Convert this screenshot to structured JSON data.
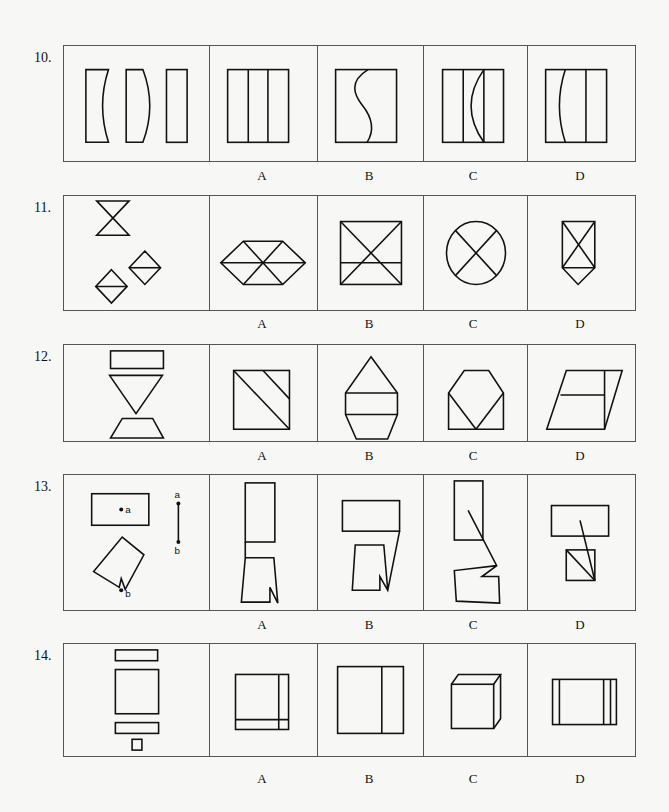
{
  "questions": [
    {
      "number": "10.",
      "options": [
        "A",
        "B",
        "C",
        "D"
      ],
      "stem_description": "three rectangles with curved edges",
      "option_descriptions": [
        "rectangle split into three by two vertical lines",
        "square with an S-curve dividing it",
        "rectangle with one vertical line and one arc",
        "rectangle with an arc and one vertical line"
      ]
    },
    {
      "number": "11.",
      "options": [
        "A",
        "B",
        "C",
        "D"
      ],
      "stem_description": "hourglass and two diamonds split horizontally",
      "option_descriptions": [
        "hexagon with three diagonals",
        "rectangle with X and horizontal line",
        "circle with X",
        "pentagon (house down) with X and horizontal line"
      ]
    },
    {
      "number": "12.",
      "options": [
        "A",
        "B",
        "C",
        "D"
      ],
      "stem_description": "rectangle, inverted triangle, trapezoid",
      "option_descriptions": [
        "square with two diagonal lines",
        "hexagonal shape with two horizontal lines",
        "octagon-topped shape with V lines",
        "parallelogram with vertical and horizontal line"
      ]
    },
    {
      "number": "13.",
      "options": [
        "A",
        "B",
        "C",
        "D"
      ],
      "stem_description": "rectangle with point a, notched rotated rectangle with point b, line segment a-b",
      "stem_labels": {
        "point_a": "a",
        "point_b": "b"
      },
      "option_descriptions": [
        "stacked rectangle and notched shape",
        "rectangle and notched shape joined by slanted line",
        "rectangle and notched shape joined by zigzag",
        "rectangle and square with diagonals"
      ]
    },
    {
      "number": "14.",
      "options": [
        "A",
        "B",
        "C",
        "D"
      ],
      "stem_description": "two thin rectangles, a large square, and a small square",
      "option_descriptions": [
        "square with one vertical and one horizontal line",
        "rectangle with one vertical line",
        "3D cube",
        "rectangle with three vertical lines"
      ]
    }
  ]
}
